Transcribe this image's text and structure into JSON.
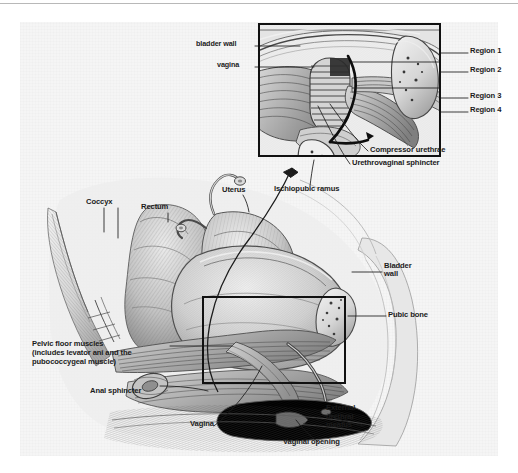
{
  "figure": {
    "kind": "anatomical-illustration",
    "style": "grayscale pencil / graphite medical drawing on textured paper",
    "colors": {
      "page_background": "#ffffff",
      "paper": "#f5f5f5",
      "ink": "#1b1b1b",
      "frame": "#111111",
      "leader": "#1b1b1b",
      "top_rule": "#b8b8b8"
    }
  },
  "top_inset": {
    "name": "magnified-urogenital-sphincter-inset",
    "labels": [
      {
        "id": "bladder-wall",
        "text": "bladder wall"
      },
      {
        "id": "vagina",
        "text": "vagina"
      }
    ],
    "regions": [
      {
        "id": "region-1",
        "text": "Region 1"
      },
      {
        "id": "region-2",
        "text": "Region 2"
      },
      {
        "id": "region-3",
        "text": "Region 3"
      },
      {
        "id": "region-4",
        "text": "Region 4"
      }
    ],
    "callouts": [
      {
        "id": "compressor-urethrae",
        "text": "Compressor urethrae"
      },
      {
        "id": "urethrovaginal-sphincter",
        "text": "Urethrovaginal sphincter"
      },
      {
        "id": "ischiopubic-ramus",
        "text": "Ischiopubic ramus"
      }
    ]
  },
  "main_view": {
    "name": "midsagittal-pelvis-view",
    "labels": [
      {
        "id": "coccyx",
        "text": "Coccyx"
      },
      {
        "id": "rectum",
        "text": "Rectum"
      },
      {
        "id": "uterus",
        "text": "Uterus"
      },
      {
        "id": "bladder-wall",
        "text": "Bladder\nwall",
        "line1": "Bladder",
        "line2": "wall"
      },
      {
        "id": "pubic-bone",
        "text": "Pubic bone"
      },
      {
        "id": "anal-sphincter",
        "text": "Anal sphincter"
      },
      {
        "id": "vagina",
        "text": "Vagina"
      },
      {
        "id": "vaginal-opening",
        "text": "Vaginal opening"
      },
      {
        "id": "external-urethral-meatus",
        "text": "External\nurethral\nmeatus",
        "line1": "External",
        "line2": "urethral",
        "line3": "meatus"
      }
    ],
    "pelvic_floor_label": {
      "id": "pelvic-floor-muscles",
      "line1": "Pelvic floor muscles",
      "line2": "(includes levator ani and the",
      "line3": "pubococcygeal muscle)"
    }
  }
}
